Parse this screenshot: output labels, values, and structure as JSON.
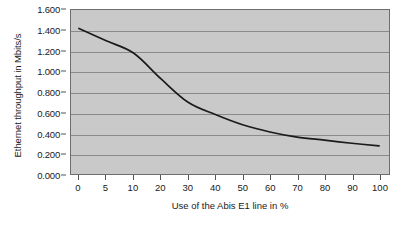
{
  "chart_data": {
    "type": "line",
    "title": "",
    "xlabel": "Use of the Abis E1 line in %",
    "ylabel": "Ethernet throughput in Mbits/s",
    "categories": [
      "0",
      "5",
      "10",
      "20",
      "30",
      "40",
      "50",
      "60",
      "70",
      "80",
      "90",
      "100"
    ],
    "values": [
      1.42,
      1.3,
      1.18,
      0.93,
      0.7,
      0.58,
      0.48,
      0.41,
      0.36,
      0.33,
      0.3,
      0.275
    ],
    "series": [
      {
        "name": "Ethernet throughput",
        "values": [
          1.42,
          1.3,
          1.18,
          0.93,
          0.7,
          0.58,
          0.48,
          0.41,
          0.36,
          0.33,
          0.3,
          0.275
        ]
      }
    ],
    "ylim": [
      0.0,
      1.6
    ],
    "ytick_labels": [
      "0.000",
      "0.200",
      "0.400",
      "0.600",
      "0.800",
      "1.000",
      "1.200",
      "1.400",
      "1.600"
    ],
    "ytick_values": [
      0.0,
      0.2,
      0.4,
      0.6,
      0.8,
      1.0,
      1.2,
      1.4,
      1.6
    ],
    "grid": true,
    "legend": "none",
    "xaxis_type": "categorical",
    "colors": {
      "plot_background": "#c9c9c9",
      "gridline": "#8a8a8a",
      "axis": "#555555",
      "line": "#1a1a1a",
      "text": "#1a1a1a",
      "page_background": "#ffffff"
    }
  }
}
